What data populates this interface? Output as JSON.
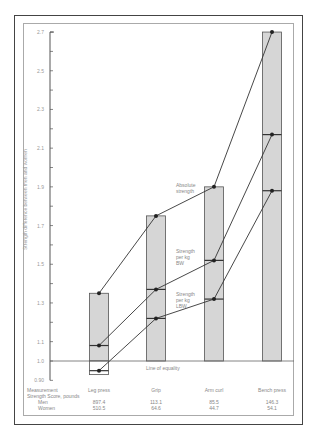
{
  "chart_data": {
    "type": "line",
    "title": "",
    "xlabel": "Measurement",
    "ylabel": "Strength difference between men and women",
    "ylim": [
      0.9,
      2.7
    ],
    "yticks": [
      "2.7",
      "2.5",
      "2.3",
      "2.1",
      "1.9",
      "1.7",
      "1.5",
      "1.3",
      "1.1",
      "1.0",
      "0.90"
    ],
    "categories": [
      "Leg press",
      "Grip",
      "Arm curl",
      "Bench press"
    ],
    "series": [
      {
        "name": "Absolute strength",
        "values": [
          1.35,
          1.75,
          1.9,
          2.7
        ]
      },
      {
        "name": "Strength per kg BW",
        "values": [
          1.08,
          1.37,
          1.52,
          2.17
        ]
      },
      {
        "name": "Strength per kg LBW",
        "values": [
          0.95,
          1.22,
          1.32,
          1.88
        ]
      }
    ],
    "annotations": [
      "Line of equality"
    ],
    "table": {
      "header": "Strength Score, pounds",
      "rows": [
        {
          "label": "Men",
          "values": [
            "897.4",
            "113.1",
            "85.5",
            "146.3"
          ]
        },
        {
          "label": "Women",
          "values": [
            "510.5",
            "64.6",
            "44.7",
            "54.1"
          ]
        }
      ]
    }
  },
  "labels": {
    "abs": [
      "Absolute",
      "strength"
    ],
    "bw": [
      "Strength",
      "per kg",
      "BW"
    ],
    "lbw": [
      "Strength",
      "per kg",
      "LBW"
    ],
    "equality": "Line of equality",
    "measurement": "Measurement",
    "score": "Strength Score, pounds",
    "men": "Men",
    "women": "Women",
    "ylabel": "Strength difference between men and women"
  }
}
